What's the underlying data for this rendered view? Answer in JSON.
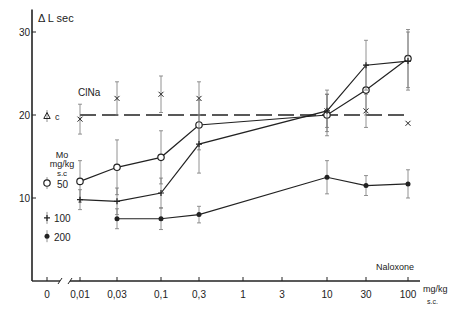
{
  "chart_data": {
    "type": "line",
    "title": "",
    "ylabel": "Δ L sec",
    "xlabel": "Naloxone",
    "x_unit": "mg/kg",
    "x_unit_sub": "s.c.",
    "ylim": [
      0,
      32
    ],
    "y_ticks": [
      10,
      20,
      30
    ],
    "y_tick_labels": [
      "10",
      "20",
      "30"
    ],
    "x_categories": [
      "0",
      "0,01",
      "0,03",
      "0,1",
      "0,3",
      "1",
      "3",
      "10",
      "30",
      "100"
    ],
    "x_values": [
      0,
      0.01,
      0.03,
      0.1,
      0.3,
      1,
      3,
      10,
      30,
      100
    ],
    "x_scale": "log (with broken axis before 0,01)",
    "legend": {
      "title_line1": "Mo",
      "title_line2": "mg/kg",
      "title_line3": "s.c",
      "control_label": "c",
      "control_value": 20,
      "entries": [
        {
          "label": "50",
          "marker": "open-circle",
          "value": 11.8
        },
        {
          "label": "100",
          "marker": "plus",
          "value": 7.6
        },
        {
          "label": "200",
          "marker": "filled-circle",
          "value": 5.4
        }
      ]
    },
    "series": [
      {
        "name": "ClNa",
        "marker": "x",
        "line": "dashed",
        "x": [
          "0,01",
          "0,03",
          "0,1",
          "0,3",
          "10",
          "30",
          "100"
        ],
        "values": [
          19.5,
          22,
          22.5,
          22,
          20.5,
          20.5,
          19
        ],
        "err": [
          1.8,
          2,
          2.2,
          2,
          2,
          2,
          0
        ],
        "line_level": 20
      },
      {
        "name": "Mo 50",
        "marker": "open-circle",
        "line": "solid",
        "x": [
          "0,01",
          "0,03",
          "0,1",
          "0,3",
          "10",
          "30",
          "100"
        ],
        "values": [
          12,
          13.7,
          14.9,
          18.8,
          20,
          23,
          26.8
        ],
        "err": [
          2.5,
          3.3,
          3.2,
          3,
          2.5,
          3,
          3.5
        ]
      },
      {
        "name": "Mo 100",
        "marker": "plus",
        "line": "solid",
        "x": [
          "0,01",
          "0,03",
          "0,1",
          "0,3",
          "10",
          "30",
          "100"
        ],
        "values": [
          9.8,
          9.6,
          10.6,
          16.5,
          20.5,
          26,
          26.5
        ],
        "err": [
          1.2,
          1.6,
          1.8,
          3.5,
          2.5,
          3,
          3.5
        ]
      },
      {
        "name": "Mo 200",
        "marker": "filled-circle",
        "line": "solid",
        "x": [
          "0,03",
          "0,1",
          "0,3",
          "10",
          "30",
          "100"
        ],
        "values": [
          7.5,
          7.5,
          8,
          12.5,
          11.5,
          11.7
        ],
        "err": [
          1.2,
          1.3,
          1,
          2,
          1.2,
          1.7
        ]
      }
    ],
    "annotations": [
      "ClNa"
    ],
    "grid": false
  }
}
